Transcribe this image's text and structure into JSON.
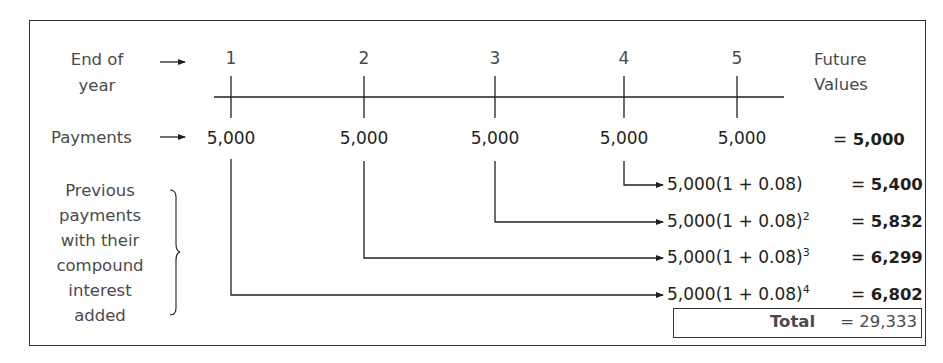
{
  "diagram": {
    "row_labels": {
      "end_of_year_line1": "End of",
      "end_of_year_line2": "year",
      "payments": "Payments",
      "previous_line1": "Previous",
      "previous_line2": "payments",
      "previous_line3": "with their",
      "previous_line4": "compound",
      "previous_line5": "interest",
      "previous_line6": "added"
    },
    "future_values_header_line1": "Future",
    "future_values_header_line2": "Values",
    "years": [
      "1",
      "2",
      "3",
      "4",
      "5"
    ],
    "payments": [
      "5,000",
      "5,000",
      "5,000",
      "5,000",
      "5,000"
    ],
    "last_payment_fv": {
      "eq": "= ",
      "value": "5,000"
    },
    "compounded_rows": [
      {
        "base": "5,000(1 + 0.08)",
        "exponent": "",
        "eq": "= ",
        "value": "5,400",
        "from_year": "4"
      },
      {
        "base": "5,000(1 + 0.08)",
        "exponent": "2",
        "eq": "= ",
        "value": "5,832",
        "from_year": "3"
      },
      {
        "base": "5,000(1 + 0.08)",
        "exponent": "3",
        "eq": "= ",
        "value": "6,299",
        "from_year": "2"
      },
      {
        "base": "5,000(1 + 0.08)",
        "exponent": "4",
        "eq": "= ",
        "value": "6,802",
        "from_year": "1"
      }
    ],
    "total": {
      "label": "Total",
      "value": "= 29,333"
    },
    "interest_rate": "0.08",
    "colors": {
      "line": "#231f20",
      "label_text": "#4a4a4a",
      "value_text": "#231f20"
    }
  }
}
